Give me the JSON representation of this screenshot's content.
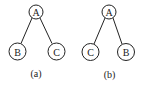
{
  "diagrams": [
    {
      "caption": "(a)",
      "root": {
        "label": "A",
        "cx": 36,
        "cy": 12
      },
      "left": {
        "label": "B",
        "cx": 17.5,
        "cy": 51.5
      },
      "right": {
        "label": "C",
        "cx": 56.5,
        "cy": 51.5
      },
      "caption_pos": {
        "x": 36,
        "y": 73
      }
    },
    {
      "caption": "(b)",
      "root": {
        "label": "A",
        "cx": 109,
        "cy": 12
      },
      "left": {
        "label": "C",
        "cx": 90.5,
        "cy": 52
      },
      "right": {
        "label": "B",
        "cx": 126,
        "cy": 52
      },
      "caption_pos": {
        "x": 109.5,
        "y": 74
      }
    }
  ],
  "style": {
    "stroke_color": "#222222",
    "root_radius": 7,
    "leaf_radius": 8.5
  }
}
